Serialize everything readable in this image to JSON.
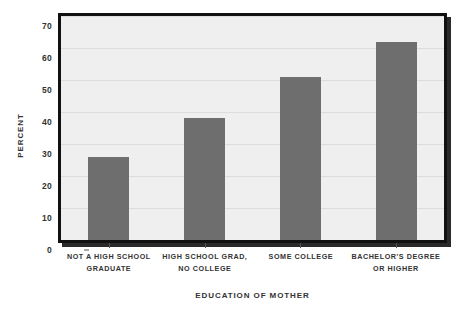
{
  "chart_data": {
    "type": "bar",
    "title": "",
    "subtitle": "",
    "xlabel": "Education of Mother",
    "ylabel": "Percent",
    "categories": [
      "Not a High School Graduate",
      "High School Grad, No College",
      "Some College",
      "Bachelor's Degree or Higher"
    ],
    "category_lines": [
      [
        "Not a High School",
        "Graduate"
      ],
      [
        "High School Grad,",
        "No College"
      ],
      [
        "Some College",
        ""
      ],
      [
        "Bachelor's Degree",
        "or Higher"
      ]
    ],
    "values": [
      26,
      38,
      51,
      62
    ],
    "ylim": [
      0,
      70
    ],
    "ytick_values": [
      0,
      10,
      20,
      30,
      40,
      50,
      60,
      70
    ],
    "ytick_labels": [
      "0",
      "10",
      "20",
      "30",
      "40",
      "50",
      "60",
      "70"
    ],
    "grid": true,
    "grid_axis": "y",
    "legend": false,
    "legend_position": "none",
    "series": [
      {
        "name": "Percent",
        "values": [
          26,
          38,
          51,
          62
        ]
      }
    ]
  },
  "style": {
    "bar_color": "#6e6e6e",
    "plot_background": "#efefef",
    "frame_color": "#111111",
    "gridline_color": "#dcdcdc",
    "text_color": "#333333",
    "page_background": "#ffffff"
  }
}
